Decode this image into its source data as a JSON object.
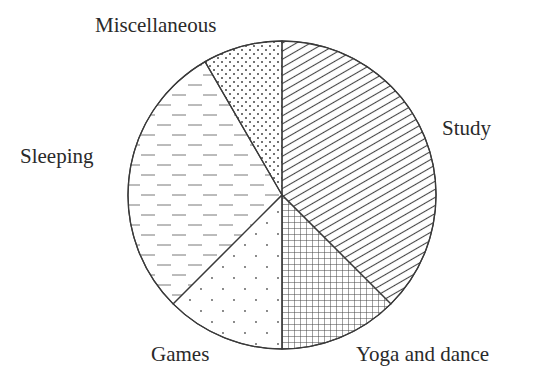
{
  "chart_data": {
    "type": "pie",
    "title": "",
    "start": "top",
    "direction": "clockwise",
    "unit": "degrees",
    "slices": [
      {
        "label": "Study",
        "value": 135,
        "pattern": "diagonal-lines"
      },
      {
        "label": "Yoga and dance",
        "value": 45,
        "pattern": "grid"
      },
      {
        "label": "Games",
        "value": 45,
        "pattern": "sparse-dots"
      },
      {
        "label": "Sleeping",
        "value": 105,
        "pattern": "dashes"
      },
      {
        "label": "Miscellaneous",
        "value": 30,
        "pattern": "dense-dots"
      }
    ],
    "legend": "none",
    "colors": {
      "stroke": "#3a3a3a",
      "fill": "#ffffff",
      "text": "#2a2a2a"
    }
  }
}
